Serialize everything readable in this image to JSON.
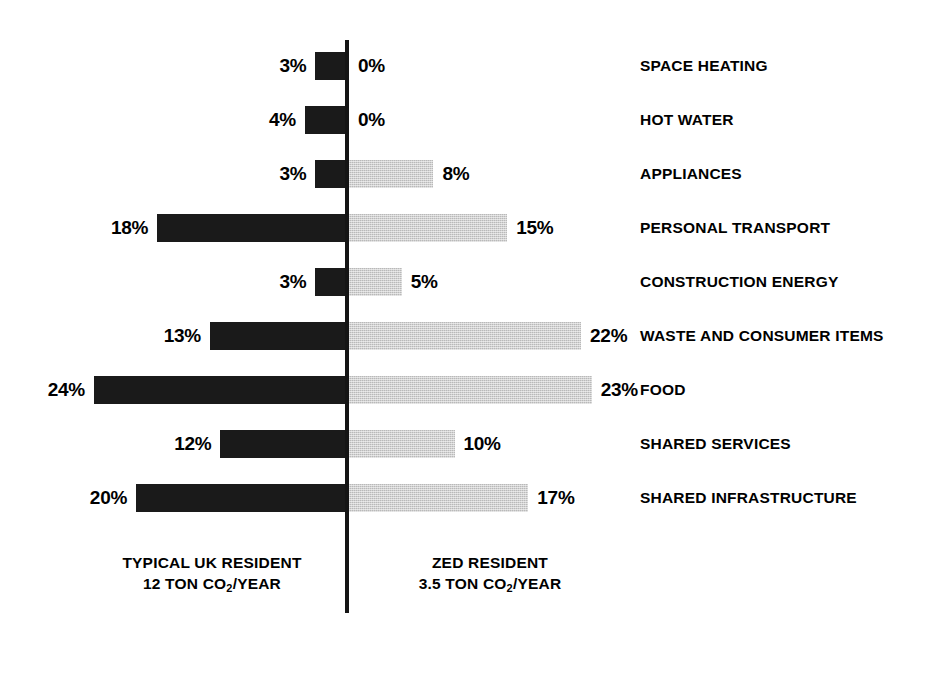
{
  "chart_data": {
    "type": "bar",
    "orientation": "horizontal-diverging",
    "title": "",
    "subtitle": "",
    "xlabel": "",
    "ylabel": "",
    "grid": false,
    "legend_position": "bottom",
    "axis_center_value": 0,
    "value_unit": "%",
    "categories": [
      "SPACE HEATING",
      "HOT WATER",
      "APPLIANCES",
      "PERSONAL TRANSPORT",
      "CONSTRUCTION ENERGY",
      "WASTE AND CONSUMER ITEMS",
      "FOOD",
      "SHARED SERVICES",
      "SHARED INFRASTRUCTURE"
    ],
    "series": [
      {
        "name": "TYPICAL UK RESIDENT",
        "side": "left",
        "color": "#1a1a1a",
        "total": "12 TON CO2/YEAR",
        "values": [
          3,
          4,
          3,
          18,
          3,
          13,
          24,
          12,
          20
        ],
        "labels": [
          "3%",
          "4%",
          "3%",
          "18%",
          "3%",
          "13%",
          "24%",
          "12%",
          "20%"
        ]
      },
      {
        "name": "ZED RESIDENT",
        "side": "right",
        "color": "#b9b9b9",
        "total": "3.5 TON CO2/YEAR",
        "values": [
          0,
          0,
          8,
          15,
          5,
          22,
          23,
          10,
          17
        ],
        "labels": [
          "0%",
          "0%",
          "8%",
          "15%",
          "5%",
          "22%",
          "23%",
          "10%",
          "17%"
        ]
      }
    ],
    "xlim": [
      -26,
      26
    ]
  },
  "rows": [
    {
      "category": "SPACE HEATING",
      "left_label": "3%",
      "left_value": 3,
      "right_label": "0%",
      "right_value": 0
    },
    {
      "category": "HOT WATER",
      "left_label": "4%",
      "left_value": 4,
      "right_label": "0%",
      "right_value": 0
    },
    {
      "category": "APPLIANCES",
      "left_label": "3%",
      "left_value": 3,
      "right_label": "8%",
      "right_value": 8
    },
    {
      "category": "PERSONAL TRANSPORT",
      "left_label": "18%",
      "left_value": 18,
      "right_label": "15%",
      "right_value": 15
    },
    {
      "category": "CONSTRUCTION ENERGY",
      "left_label": "3%",
      "left_value": 3,
      "right_label": "5%",
      "right_value": 5
    },
    {
      "category": "WASTE AND CONSUMER ITEMS",
      "left_label": "13%",
      "left_value": 13,
      "right_label": "22%",
      "right_value": 22
    },
    {
      "category": "FOOD",
      "left_label": "24%",
      "left_value": 24,
      "right_label": "23%",
      "right_value": 23
    },
    {
      "category": "SHARED SERVICES",
      "left_label": "12%",
      "left_value": 12,
      "right_label": "10%",
      "right_value": 10
    },
    {
      "category": "SHARED INFRASTRUCTURE",
      "left_label": "20%",
      "left_value": 20,
      "right_label": "17%",
      "right_value": 17
    }
  ],
  "footer": {
    "left": {
      "name": "TYPICAL UK RESIDENT",
      "amount": "12 TON CO",
      "subscript": "2",
      "amount_suffix": "/YEAR"
    },
    "right": {
      "name": "ZED RESIDENT",
      "amount": "3.5 TON CO",
      "subscript": "2",
      "amount_suffix": "/YEAR"
    }
  },
  "style": {
    "left_bar_color": "#1a1a1a",
    "right_bar_color": "#b9b9b9",
    "axis_color": "#151515",
    "background": "#ffffff",
    "text_color": "#000000"
  },
  "geometry": {
    "px_per_percent": 10.55,
    "row_pitch": 54,
    "bar_height": 28,
    "axis_x": 347,
    "first_row_top": 39,
    "label_gap": 9,
    "category_x": 640
  }
}
